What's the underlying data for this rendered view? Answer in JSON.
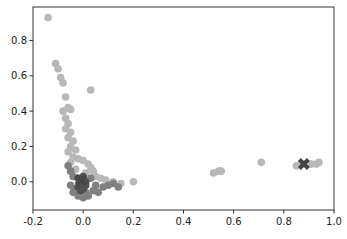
{
  "chart_data": {
    "type": "scatter",
    "title": "",
    "xlabel": "",
    "ylabel": "",
    "xlim": [
      -0.2,
      1.0
    ],
    "ylim": [
      -0.16,
      0.99
    ],
    "grid": false,
    "legend": null,
    "xticks": [
      -0.2,
      0.0,
      0.2,
      0.4,
      0.6,
      0.8,
      1.0
    ],
    "xtick_labels": [
      "-0.2",
      "0.0",
      "0.2",
      "0.4",
      "0.6",
      "0.8",
      "1.0"
    ],
    "yticks": [
      0.0,
      0.2,
      0.4,
      0.6,
      0.8
    ],
    "ytick_labels": [
      "0.0",
      "0.2",
      "0.4",
      "0.6",
      "0.8"
    ],
    "series": [
      {
        "name": "cluster-light",
        "color": "#b8b8b8",
        "marker": "circle",
        "points": [
          [
            -0.14,
            0.93
          ],
          [
            -0.11,
            0.67
          ],
          [
            -0.1,
            0.64
          ],
          [
            -0.09,
            0.59
          ],
          [
            -0.08,
            0.56
          ],
          [
            -0.07,
            0.48
          ],
          [
            -0.06,
            0.42
          ],
          [
            -0.05,
            0.41
          ],
          [
            0.03,
            0.52
          ],
          [
            -0.08,
            0.4
          ],
          [
            -0.07,
            0.36
          ],
          [
            -0.06,
            0.33
          ],
          [
            -0.07,
            0.3
          ],
          [
            -0.05,
            0.28
          ],
          [
            -0.06,
            0.25
          ],
          [
            -0.04,
            0.23
          ],
          [
            -0.05,
            0.2
          ],
          [
            -0.03,
            0.18
          ],
          [
            -0.06,
            0.17
          ],
          [
            -0.04,
            0.14
          ],
          [
            -0.02,
            0.13
          ],
          [
            0.0,
            0.12
          ],
          [
            -0.05,
            0.11
          ],
          [
            0.02,
            0.1
          ],
          [
            0.03,
            0.08
          ],
          [
            0.04,
            0.06
          ],
          [
            -0.03,
            0.07
          ],
          [
            0.01,
            0.05
          ],
          [
            0.05,
            0.03
          ],
          [
            0.07,
            0.02
          ],
          [
            0.09,
            0.01
          ],
          [
            0.12,
            0.0
          ],
          [
            0.15,
            -0.01
          ],
          [
            0.2,
            0.0
          ],
          [
            0.52,
            0.05
          ],
          [
            0.54,
            0.06
          ],
          [
            0.55,
            0.06
          ],
          [
            0.71,
            0.11
          ],
          [
            0.85,
            0.09
          ],
          [
            0.87,
            0.1
          ],
          [
            0.91,
            0.1
          ],
          [
            0.93,
            0.1
          ],
          [
            0.94,
            0.11
          ]
        ]
      },
      {
        "name": "cluster-mid",
        "color": "#808080",
        "marker": "circle",
        "points": [
          [
            -0.06,
            0.09
          ],
          [
            -0.05,
            0.06
          ],
          [
            -0.04,
            0.03
          ],
          [
            -0.05,
            -0.02
          ],
          [
            -0.04,
            -0.06
          ],
          [
            -0.02,
            -0.08
          ],
          [
            0.0,
            -0.09
          ],
          [
            0.02,
            -0.08
          ],
          [
            0.04,
            -0.05
          ],
          [
            0.05,
            -0.02
          ],
          [
            0.06,
            -0.06
          ],
          [
            0.08,
            -0.03
          ],
          [
            0.1,
            -0.02
          ],
          [
            0.12,
            -0.01
          ],
          [
            0.14,
            -0.03
          ],
          [
            0.03,
            0.02
          ],
          [
            -0.03,
            -0.04
          ],
          [
            0.01,
            -0.06
          ]
        ]
      },
      {
        "name": "cluster-dark",
        "color": "#505050",
        "marker": "circle",
        "points": [
          [
            -0.02,
            0.02
          ],
          [
            0.0,
            0.03
          ],
          [
            -0.01,
            0.0
          ],
          [
            0.01,
            0.0
          ],
          [
            -0.02,
            -0.03
          ],
          [
            0.0,
            -0.04
          ],
          [
            0.01,
            -0.02
          ],
          [
            -0.01,
            -0.05
          ]
        ]
      },
      {
        "name": "centroids",
        "color": "#454545",
        "marker": "x",
        "points": [
          [
            -0.01,
            0.01
          ],
          [
            0.88,
            0.1
          ]
        ]
      }
    ]
  }
}
